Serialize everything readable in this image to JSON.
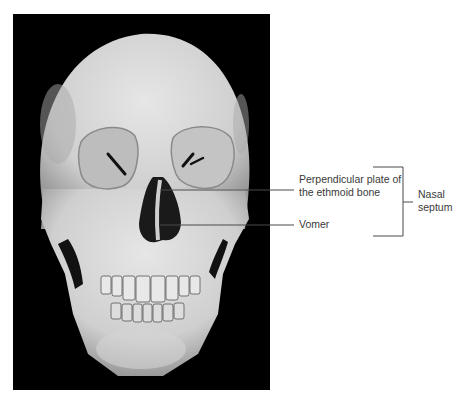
{
  "figure": {
    "labels": {
      "ethmoid_line1": "Perpendicular plate of",
      "ethmoid_line2": "the ethmoid bone",
      "vomer": "Vomer",
      "septum_line1": "Nasal",
      "septum_line2": "septum"
    },
    "colors": {
      "background": "#ffffff",
      "photo_background": "#000000",
      "bone": "#d9d9d9",
      "leader_line": "#4a4a4a",
      "label_text": "#3a3a3a"
    }
  }
}
